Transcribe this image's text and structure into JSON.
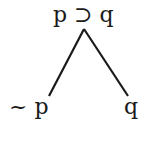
{
  "diagram": {
    "type": "truth-tree",
    "root": {
      "label": "p ⊃ q"
    },
    "branches": [
      {
        "label": "~ p"
      },
      {
        "label": "q"
      }
    ],
    "colors": {
      "ink": "#1a1a1a",
      "background": "#ffffff"
    }
  }
}
